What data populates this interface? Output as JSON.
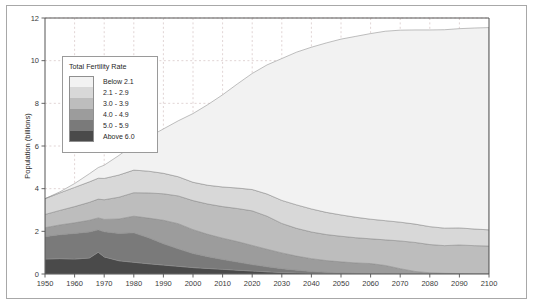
{
  "legend": {
    "title": "Total Fertility Rate",
    "items": [
      {
        "label": "Below 2.1",
        "color": "#f2f2f2"
      },
      {
        "label": "2.1 - 2.9",
        "color": "#d8d8d8"
      },
      {
        "label": "3.0 - 3.9",
        "color": "#bdbdbd"
      },
      {
        "label": "4.0 - 4.9",
        "color": "#9c9c9c"
      },
      {
        "label": "5.0 - 5.9",
        "color": "#7a7a7a"
      },
      {
        "label": "Above 6.0",
        "color": "#4a4a4a"
      }
    ]
  },
  "chart_data": {
    "type": "area",
    "title": "",
    "xlabel": "",
    "ylabel": "Population (billions)",
    "xlim": [
      1950,
      2100
    ],
    "ylim": [
      0,
      12
    ],
    "xticks": [
      1950,
      1960,
      1970,
      1980,
      1990,
      2000,
      2010,
      2020,
      2030,
      2040,
      2050,
      2060,
      2070,
      2080,
      2090,
      2100
    ],
    "yticks": [
      0,
      2,
      4,
      6,
      8,
      10,
      12
    ],
    "grid": true,
    "legend_position": "upper-left-inside",
    "stacked": true,
    "x": [
      1950,
      1955,
      1960,
      1965,
      1968,
      1970,
      1975,
      1980,
      1985,
      1990,
      1995,
      2000,
      2005,
      2010,
      2015,
      2020,
      2025,
      2030,
      2035,
      2040,
      2045,
      2050,
      2055,
      2060,
      2065,
      2070,
      2075,
      2080,
      2085,
      2090,
      2095,
      2100
    ],
    "series": [
      {
        "name": "Above 6.0",
        "color": "#4a4a4a",
        "values": [
          0.7,
          0.72,
          0.7,
          0.75,
          1.02,
          0.8,
          0.62,
          0.55,
          0.48,
          0.42,
          0.36,
          0.3,
          0.26,
          0.22,
          0.18,
          0.14,
          0.1,
          0.07,
          0.05,
          0.03,
          0.02,
          0.01,
          0.0,
          0.0,
          0.0,
          0.0,
          0.0,
          0.0,
          0.0,
          0.0,
          0.0,
          0.0
        ]
      },
      {
        "name": "5.0 - 5.9",
        "color": "#7a7a7a",
        "values": [
          1.05,
          1.12,
          1.2,
          1.22,
          1.05,
          1.18,
          1.28,
          1.38,
          1.22,
          1.0,
          0.82,
          0.66,
          0.55,
          0.46,
          0.38,
          0.3,
          0.24,
          0.18,
          0.13,
          0.09,
          0.06,
          0.04,
          0.02,
          0.01,
          0.0,
          0.0,
          0.0,
          0.0,
          0.0,
          0.0,
          0.0,
          0.0
        ]
      },
      {
        "name": "4.0 - 4.9",
        "color": "#9c9c9c",
        "values": [
          0.42,
          0.46,
          0.5,
          0.55,
          0.56,
          0.58,
          0.68,
          0.78,
          0.92,
          1.1,
          1.18,
          1.12,
          1.05,
          1.0,
          0.96,
          0.9,
          0.82,
          0.74,
          0.66,
          0.6,
          0.55,
          0.52,
          0.5,
          0.48,
          0.4,
          0.25,
          0.12,
          0.06,
          0.03,
          0.02,
          0.01,
          0.01
        ]
      },
      {
        "name": "3.0 - 3.9",
        "color": "#bdbdbd",
        "values": [
          0.62,
          0.68,
          0.76,
          0.84,
          0.88,
          0.92,
          1.02,
          1.1,
          1.18,
          1.24,
          1.3,
          1.36,
          1.42,
          1.48,
          1.55,
          1.62,
          1.55,
          1.38,
          1.3,
          1.25,
          1.22,
          1.2,
          1.18,
          1.16,
          1.2,
          1.3,
          1.36,
          1.32,
          1.3,
          1.34,
          1.32,
          1.3
        ]
      },
      {
        "name": "2.1 - 2.9",
        "color": "#d8d8d8",
        "values": [
          0.74,
          0.82,
          0.9,
          0.96,
          0.98,
          1.0,
          1.04,
          1.06,
          1.02,
          0.96,
          0.9,
          0.86,
          0.88,
          0.92,
          0.96,
          1.0,
          1.04,
          1.08,
          1.1,
          1.08,
          1.04,
          1.0,
          0.96,
          0.92,
          0.9,
          0.88,
          0.86,
          0.84,
          0.82,
          0.8,
          0.78,
          0.76
        ]
      },
      {
        "name": "Below 2.1",
        "color": "#f2f2f2",
        "values": [
          0.0,
          0.05,
          0.18,
          0.38,
          0.5,
          0.62,
          0.92,
          1.2,
          1.6,
          2.08,
          2.62,
          3.22,
          3.78,
          4.32,
          4.88,
          5.44,
          6.05,
          6.65,
          7.16,
          7.58,
          7.94,
          8.24,
          8.48,
          8.7,
          8.88,
          9.0,
          9.1,
          9.22,
          9.3,
          9.34,
          9.42,
          9.48
        ]
      }
    ],
    "totals_note": "Total population rises from about 2.5 billion in 1950 to about 10.5 billion in 2100"
  }
}
